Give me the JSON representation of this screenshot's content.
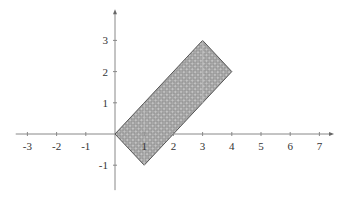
{
  "chart_data": {
    "type": "area",
    "title": "",
    "xlabel": "",
    "ylabel": "",
    "xlim": [
      -3.4,
      7.4
    ],
    "ylim": [
      -1.8,
      3.9
    ],
    "grid": false,
    "legend": null,
    "x_ticks": [
      -3,
      -2,
      -1,
      1,
      2,
      3,
      4,
      5,
      6,
      7
    ],
    "y_ticks": [
      -1,
      1,
      2,
      3
    ],
    "series": [
      {
        "name": "shaded-rectangle",
        "kind": "polygon",
        "vertices": [
          [
            0,
            0
          ],
          [
            3,
            3
          ],
          [
            4,
            2
          ],
          [
            1,
            -1
          ]
        ],
        "fill": "#a9a9a9",
        "stroke": "#555555",
        "pattern": "dotted-hatch"
      }
    ]
  },
  "layout": {
    "origin_px": [
      115,
      134
    ],
    "unit_x_px": 29.2,
    "unit_y_px": 31.2,
    "axis_color": "#888888",
    "tick_label_color": "#333333"
  }
}
